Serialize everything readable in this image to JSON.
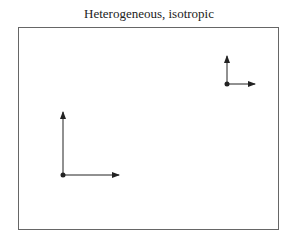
{
  "title": "Heterogeneous, isotropic",
  "colors": {
    "line": "#222222",
    "frame": "#666666"
  },
  "axes_pairs": [
    {
      "origin": [
        227,
        84
      ],
      "up_tip": [
        227,
        56
      ],
      "right_tip": [
        255,
        84
      ]
    },
    {
      "origin": [
        63,
        175
      ],
      "up_tip": [
        63,
        112
      ],
      "right_tip": [
        119,
        175
      ]
    }
  ]
}
